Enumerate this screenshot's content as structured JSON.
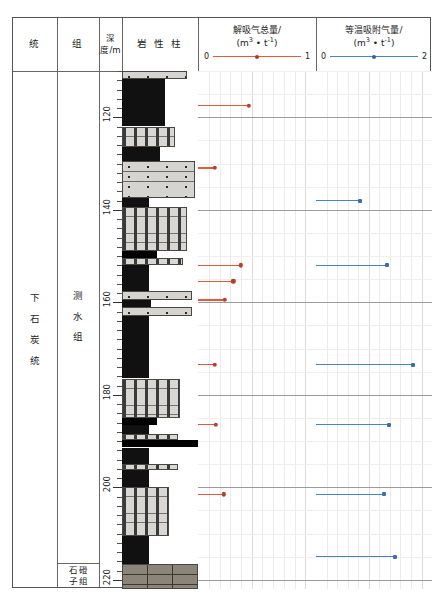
{
  "table": {
    "headers": [
      {
        "name": "series",
        "label": "统"
      },
      {
        "name": "formation",
        "label": "组"
      },
      {
        "name": "depth",
        "label": "深度/m"
      },
      {
        "name": "lithology",
        "label": "岩 性 柱"
      }
    ]
  },
  "series_label": [
    "下",
    "石",
    "炭",
    "统"
  ],
  "formations": [
    {
      "name": "ceshui",
      "chars": [
        "测",
        "水",
        "组"
      ]
    },
    {
      "name": "shidengzi",
      "col1": [
        "石",
        "子"
      ],
      "col2": [
        "磴",
        "组"
      ]
    }
  ],
  "depth_axis": {
    "unit": "m",
    "labels": [
      "120",
      "140",
      "160",
      "180",
      "200",
      "220"
    ],
    "min": 110,
    "max": 222
  },
  "panels": [
    {
      "name": "desorption-gas",
      "title_line1": "解吸气总量/",
      "title_line2_pre": "(m",
      "title_line2_sup1": "3",
      "title_line2_mid": " • t",
      "title_line2_sup2": "-1",
      "title_line2_post": ")",
      "axis_min_label": "0",
      "axis_max_label": "1",
      "color": "#e05a3d",
      "xmin": 0,
      "xmax": 1
    },
    {
      "name": "isothermal-adsorption",
      "title_line1": "等温吸附气量/",
      "title_line2_pre": "(m",
      "title_line2_sup1": "3",
      "title_line2_mid": " • t",
      "title_line2_sup2": "-1",
      "title_line2_post": ")",
      "axis_min_label": "0",
      "axis_max_label": "2",
      "color": "#4a82c4",
      "xmin": 0,
      "xmax": 2
    }
  ],
  "chart_data": {
    "type": "scatter",
    "ylabel": "深度/m",
    "ylim": [
      110,
      222
    ],
    "y_inverted": true,
    "y_ticks": [
      120,
      140,
      160,
      180,
      200,
      220
    ],
    "series": [
      {
        "name": "解吸气总量",
        "xlabel": "解吸气总量/(m3·t-1)",
        "xlim": [
          0,
          1
        ],
        "color": "#e05a3d",
        "marker": "circle",
        "stem": true,
        "points": [
          {
            "depth": 117.5,
            "value": 0.43
          },
          {
            "depth": 131.0,
            "value": 0.14
          },
          {
            "depth": 152.0,
            "value": 0.36
          },
          {
            "depth": 155.5,
            "value": 0.3
          },
          {
            "depth": 159.5,
            "value": 0.23
          },
          {
            "depth": 173.5,
            "value": 0.14
          },
          {
            "depth": 186.5,
            "value": 0.15
          },
          {
            "depth": 201.5,
            "value": 0.22
          }
        ]
      },
      {
        "name": "等温吸附气量",
        "xlabel": "等温吸附气量/(m3·t-1)",
        "xlim": [
          0,
          2
        ],
        "color": "#4a82c4",
        "marker": "square",
        "stem": true,
        "points": [
          {
            "depth": 138.0,
            "value": 0.76
          },
          {
            "depth": 152.0,
            "value": 1.22
          },
          {
            "depth": 173.5,
            "value": 1.68
          },
          {
            "depth": 186.5,
            "value": 1.26
          },
          {
            "depth": 201.5,
            "value": 1.18
          },
          {
            "depth": 215.0,
            "value": 1.36
          }
        ]
      }
    ],
    "lithology_log": {
      "xlabel": "岩 性 柱",
      "units": [
        {
          "top": 110.0,
          "base": 111.8,
          "rock": "sandstone",
          "width_pct": 86
        },
        {
          "top": 111.8,
          "base": 122.0,
          "rock": "coal",
          "width_pct": 56
        },
        {
          "top": 122.0,
          "base": 126.5,
          "rock": "siltstone",
          "width_pct": 70
        },
        {
          "top": 126.5,
          "base": 129.5,
          "rock": "coal",
          "width_pct": 50
        },
        {
          "top": 129.5,
          "base": 137.5,
          "rock": "sandstone",
          "width_pct": 96
        },
        {
          "top": 137.5,
          "base": 139.5,
          "rock": "coal",
          "width_pct": 36
        },
        {
          "top": 139.5,
          "base": 149.0,
          "rock": "siltstone",
          "width_pct": 86
        },
        {
          "top": 149.0,
          "base": 150.5,
          "rock": "band",
          "width_pct": 46
        },
        {
          "top": 150.5,
          "base": 152.0,
          "rock": "siltstone",
          "width_pct": 80
        },
        {
          "top": 152.0,
          "base": 157.5,
          "rock": "coal",
          "width_pct": 36
        },
        {
          "top": 157.5,
          "base": 159.5,
          "rock": "sandstone",
          "width_pct": 92
        },
        {
          "top": 159.5,
          "base": 161.0,
          "rock": "coal",
          "width_pct": 38
        },
        {
          "top": 161.0,
          "base": 163.0,
          "rock": "sandstone",
          "width_pct": 92
        },
        {
          "top": 163.0,
          "base": 176.5,
          "rock": "coal",
          "width_pct": 36
        },
        {
          "top": 176.5,
          "base": 185.0,
          "rock": "siltstone",
          "width_pct": 76
        },
        {
          "top": 185.0,
          "base": 186.5,
          "rock": "band",
          "width_pct": 46
        },
        {
          "top": 186.5,
          "base": 188.5,
          "rock": "coal",
          "width_pct": 36
        },
        {
          "top": 188.5,
          "base": 189.8,
          "rock": "siltstone",
          "width_pct": 74
        },
        {
          "top": 189.8,
          "base": 191.4,
          "rock": "band",
          "width_pct": 100
        },
        {
          "top": 191.4,
          "base": 195.0,
          "rock": "coal",
          "width_pct": 36
        },
        {
          "top": 195.0,
          "base": 196.2,
          "rock": "siltstone",
          "width_pct": 74
        },
        {
          "top": 196.2,
          "base": 200.0,
          "rock": "coal",
          "width_pct": 36
        },
        {
          "top": 200.0,
          "base": 210.5,
          "rock": "siltstone",
          "width_pct": 62
        },
        {
          "top": 210.5,
          "base": 216.5,
          "rock": "coal",
          "width_pct": 36
        },
        {
          "top": 216.5,
          "base": 222.0,
          "rock": "limestone",
          "width_pct": 100
        }
      ]
    }
  }
}
